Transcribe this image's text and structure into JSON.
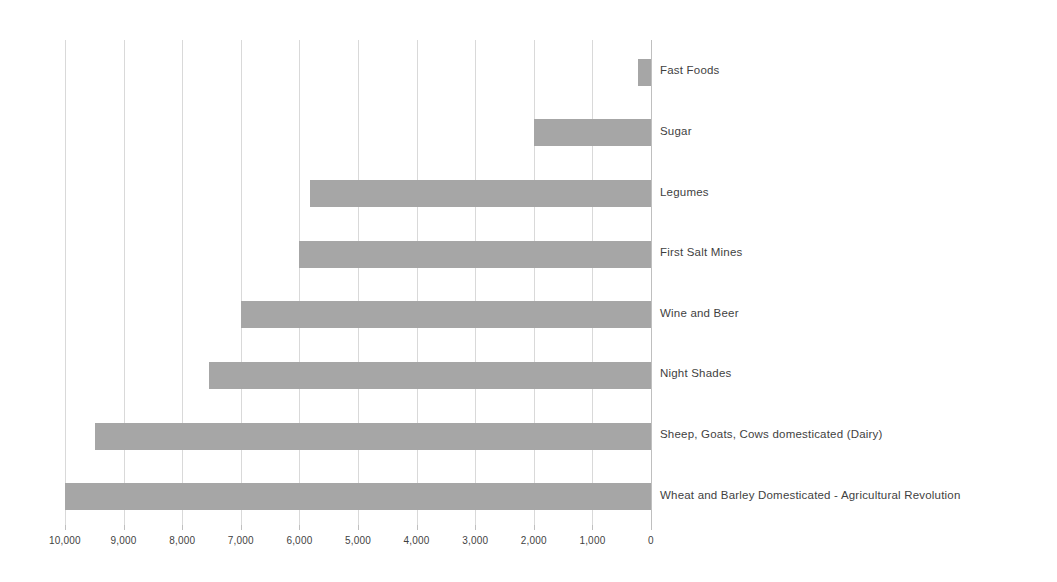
{
  "chart_data": {
    "type": "bar",
    "orientation": "horizontal",
    "title": "",
    "subtitle": "",
    "xlabel": "",
    "ylabel": "",
    "xlim": [
      10000,
      0
    ],
    "x_axis_reversed": true,
    "grid": true,
    "legend": false,
    "units": "years ago",
    "tick_labels": [
      "10,000",
      "9,000",
      "8,000",
      "7,000",
      "6,000",
      "5,000",
      "4,000",
      "3,000",
      "2,000",
      "1,000",
      "0"
    ],
    "ticks": [
      10000,
      9000,
      8000,
      7000,
      6000,
      5000,
      4000,
      3000,
      2000,
      1000,
      0
    ],
    "categories": [
      "Fast Foods",
      "Sugar",
      "Legumes",
      "First Salt Mines",
      "Wine and Beer",
      "Night Shades",
      "Sheep, Goats, Cows domesticated (Dairy)",
      "Wheat and Barley Domesticated - Agricultural Revolution"
    ],
    "values": [
      230,
      2000,
      5815,
      6000,
      7000,
      7540,
      9480,
      10000
    ],
    "bar_color": "#a6a6a6",
    "gridline_color": "#d9d9d9",
    "axis_color": "#bfbfbf",
    "text_color": "#3f3f3f"
  }
}
